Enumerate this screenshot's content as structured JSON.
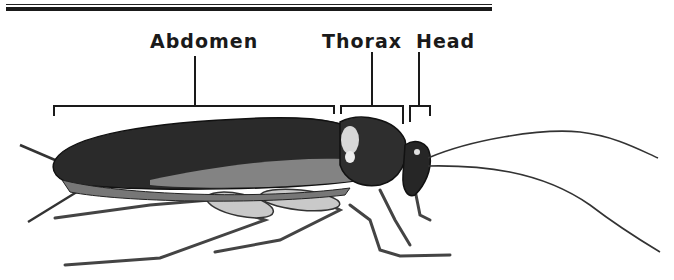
{
  "diagram": {
    "labels": [
      {
        "id": "abdomen",
        "text": "Abdomen"
      },
      {
        "id": "thorax",
        "text": "Thorax"
      },
      {
        "id": "head",
        "text": "Head"
      }
    ],
    "colors": {
      "ink": "#1a1a1a",
      "background": "#ffffff"
    }
  }
}
